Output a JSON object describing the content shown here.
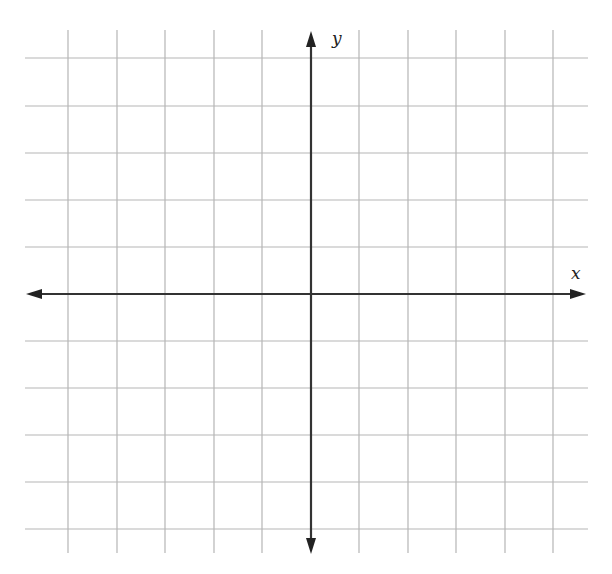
{
  "diagram": {
    "type": "coordinate-plane",
    "x_axis_label": "x",
    "y_axis_label": "y",
    "grid": {
      "columns": 10,
      "rows": 10,
      "vertical_lines_x": [
        68,
        117,
        165,
        214,
        262,
        359,
        408,
        456,
        505,
        553
      ],
      "horizontal_lines_y": [
        58,
        106,
        153,
        200,
        247,
        341,
        388,
        435,
        482,
        529
      ],
      "x_extent": [
        25,
        588
      ],
      "y_extent": [
        30,
        553
      ],
      "line_color": "#b5b5b5"
    },
    "axes": {
      "origin": [
        311,
        294
      ],
      "color": "#333333",
      "x_range": [
        -6,
        6
      ],
      "y_range": [
        -6,
        6
      ]
    }
  }
}
